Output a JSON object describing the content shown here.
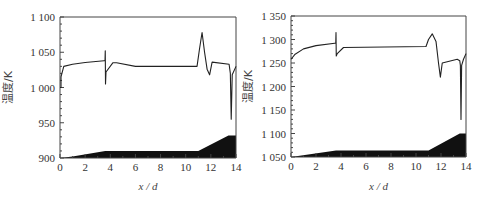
{
  "chart_data": [
    {
      "type": "line",
      "title": "",
      "xlabel": "x/d",
      "ylabel": "温度/K",
      "xlim": [
        0,
        14
      ],
      "ylim": [
        900,
        1100
      ],
      "xticks": [
        0,
        2,
        4,
        6,
        8,
        10,
        12,
        14
      ],
      "yticks": [
        900,
        950,
        1000,
        1050,
        1100
      ],
      "ytick_labels": [
        "900",
        "950",
        "1 000",
        "1 050",
        "1 100"
      ],
      "grid": false,
      "series": [
        {
          "name": "temperature",
          "x": [
            0,
            0.08,
            0.08,
            0.3,
            1,
            2,
            3.5,
            3.58,
            3.6,
            3.62,
            3.66,
            4.2,
            4.5,
            6,
            10.9,
            11.1,
            11.3,
            11.5,
            11.7,
            11.9,
            12.1,
            13.45,
            13.55,
            13.62,
            13.7,
            14
          ],
          "y": [
            1000,
            1000,
            1015,
            1030,
            1033,
            1035.5,
            1038,
            1038,
            1052,
            1005,
            1022,
            1035,
            1035,
            1030,
            1030,
            1055,
            1078,
            1050,
            1026,
            1018,
            1036,
            1033,
            1020,
            955,
            1018,
            1030
          ]
        },
        {
          "name": "geometry-profile",
          "type": "area",
          "x": [
            0,
            1,
            3.6,
            11,
            13.4,
            14
          ],
          "y": [
            900,
            902,
            910,
            910,
            932,
            932
          ]
        }
      ]
    },
    {
      "type": "line",
      "title": "",
      "xlabel": "x/d",
      "ylabel": "温度/K",
      "xlim": [
        0,
        14
      ],
      "ylim": [
        1050,
        1350
      ],
      "xticks": [
        0,
        2,
        4,
        6,
        8,
        10,
        12,
        14
      ],
      "yticks": [
        1050,
        1100,
        1150,
        1200,
        1250,
        1300,
        1350
      ],
      "ytick_labels": [
        "1 050",
        "1 100",
        "1 150",
        "1 200",
        "1 250",
        "1 300",
        "1 350"
      ],
      "grid": false,
      "series": [
        {
          "name": "temperature",
          "x": [
            0,
            0.3,
            1,
            2,
            3.5,
            3.58,
            3.6,
            3.62,
            3.7,
            4.2,
            10.8,
            11,
            11.3,
            11.6,
            11.8,
            11.95,
            12.1,
            13.3,
            13.5,
            13.55,
            13.6,
            13.65,
            13.8,
            14
          ],
          "y": [
            1258,
            1268,
            1280,
            1287,
            1292,
            1292,
            1315,
            1265,
            1270,
            1283,
            1285,
            1300,
            1312,
            1296,
            1250,
            1220,
            1250,
            1258,
            1255,
            1245,
            1130,
            1245,
            1258,
            1270
          ]
        },
        {
          "name": "geometry-profile",
          "type": "area",
          "x": [
            0,
            3.6,
            11,
            13.5,
            14
          ],
          "y": [
            1050,
            1064,
            1064,
            1100,
            1100
          ]
        }
      ]
    }
  ],
  "plots": [
    {
      "px": {
        "x0": 60,
        "x1": 236,
        "y0": 158,
        "y1": 17
      },
      "xlabel_text": "x / d",
      "ylabel_text": "温度/K"
    },
    {
      "px": {
        "x0": 291,
        "x1": 466,
        "y0": 157,
        "y1": 16
      },
      "xlabel_text": "x / d",
      "ylabel_text": "温度/K"
    }
  ],
  "colors": {
    "line": "#222222",
    "fill": "#111111",
    "axis": "#444444"
  }
}
